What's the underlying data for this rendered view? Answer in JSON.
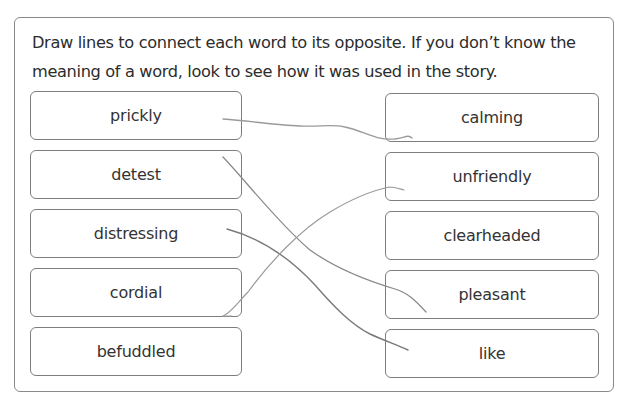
{
  "worksheet": {
    "instructions": "Draw lines to connect each word to its opposite. If you don’t know the meaning of a word, look to see how it was used in the story.",
    "left_words": [
      {
        "label": "prickly"
      },
      {
        "label": "detest"
      },
      {
        "label": "distressing"
      },
      {
        "label": "cordial"
      },
      {
        "label": "befuddled"
      }
    ],
    "right_words": [
      {
        "label": "calming"
      },
      {
        "label": "unfriendly"
      },
      {
        "label": "clearheaded"
      },
      {
        "label": "pleasant"
      },
      {
        "label": "like"
      }
    ],
    "drawn_connections": [
      {
        "from": "prickly",
        "to": "calming"
      },
      {
        "from": "detest",
        "to": "pleasant"
      },
      {
        "from": "distressing",
        "to": "like"
      },
      {
        "from": "cordial",
        "to": "unfriendly"
      }
    ],
    "colors": {
      "border": "#7d7d7d",
      "text": "#2c2c2c",
      "pencil_line": "#8c8c8c"
    }
  }
}
